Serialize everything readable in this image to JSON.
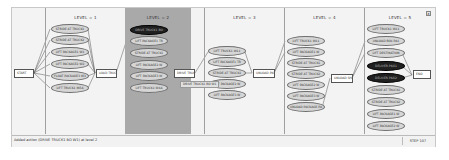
{
  "window": {
    "close_label": "x"
  },
  "start": {
    "label": "START"
  },
  "end": {
    "label": "END"
  },
  "levels": [
    {
      "title": "LEVEL = 1",
      "active": false,
      "actions": [
        "STRIDE AT TRUCK1",
        "STRIDE AT TRUCK2",
        "LIFT PACKAGE1 W1",
        "LIFT PACKAGE2 W2",
        "FLOAT PACKAGE3 W3",
        "LIFT TRUCK1 IN5A"
      ],
      "goal": "LOAD TRUCK1"
    },
    {
      "title": "LEVEL = 2",
      "active": true,
      "actions": [
        "DRIVE TRUCK1 BO",
        "LIFT PACKAGE1 TR",
        "STRIDE AT TRUCK1",
        "LIFT PACKAGE2 W",
        "LIFT PACKAGE3 W",
        "LIFT TRUCK1 W4A"
      ],
      "dark_index": 0,
      "goal": "DRIVE TRUCK1",
      "tooltip": "DRIVE TRUCK1 BO W1"
    },
    {
      "title": "LEVEL = 3",
      "active": false,
      "actions": [
        "LIFT TRUCK1 W11",
        "LIFT PACKAGE1 TR",
        "STRIDE AT TRUCK1",
        "LIFT PACKAGE2 W",
        "LIFT PACKAGE3 W"
      ],
      "goal": "UNLOAD PKG"
    },
    {
      "title": "LEVEL = 4",
      "active": false,
      "actions": [
        "LIFT TRUCK1 W11",
        "LIFT PACKAGE1 W",
        "STRIDE AT TRUCK1",
        "STRIDE AT TRUCK2",
        "LIFT PACKAGE2 W",
        "LIFT PACKAGE3 W",
        "UNLOAD PACKAGE PA"
      ],
      "goal": "UNLOAD SHR"
    },
    {
      "title": "LEVEL = 5",
      "active": false,
      "actions": [
        "LIFT TRUCK1 W11",
        "UNLOAD BOX PA1",
        "LIFT DESTINATION",
        "DELIVER PKG1",
        "DELIVER PKG2",
        "STRIDE AT TRUCK1",
        "STRIDE AT TRUCK2",
        "LIFT PACKAGE1 W",
        "LIFT PACKAGE2 W"
      ],
      "dark_indices": [
        3,
        4
      ]
    }
  ],
  "status": {
    "message": "Added action (DRIVE TRUCK1 BO W1) at level 2",
    "step": "STEP 107"
  }
}
